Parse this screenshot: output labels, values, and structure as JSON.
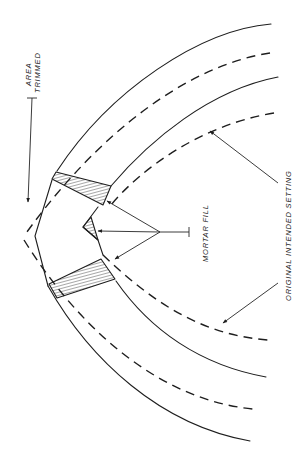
{
  "figure": {
    "title": "",
    "labels": {
      "area_trimmed_line1": "AREA",
      "area_trimmed_line2": "TRIMMED",
      "mortar_fill": "MORTAR FILL",
      "original_intended_setting": "ORIGINAL INTENDED SETTING"
    },
    "elements": [
      "outer solid arch course (as laid)",
      "dashed arch course (original intended setting)",
      "inner solid arch course",
      "inner dashed arch course",
      "trimmed crown",
      "hatched mortar fill wedges (3)",
      "leader arrows"
    ],
    "colors": {
      "ink": "#1e1e1e",
      "paper": "#ffffff"
    }
  }
}
